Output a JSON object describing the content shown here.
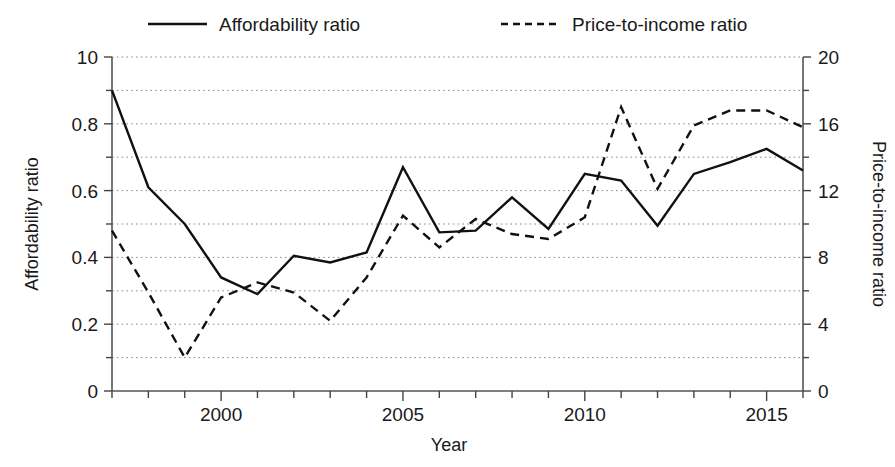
{
  "chart_data": {
    "type": "line",
    "title": "",
    "xlabel": "Year",
    "ylabel": "Affordability ratio",
    "y2label": "Price-to-income ratio",
    "grid": true,
    "legend_position": "top",
    "x": [
      1997,
      1998,
      1999,
      2000,
      2001,
      2002,
      2003,
      2004,
      2005,
      2006,
      2007,
      2008,
      2009,
      2010,
      2011,
      2012,
      2013,
      2014,
      2015,
      2016
    ],
    "xlim": [
      1997,
      2016
    ],
    "xticks": [
      2000,
      2005,
      2010,
      2015
    ],
    "xtick_labels": [
      "2000",
      "2005",
      "2010",
      "2015"
    ],
    "xticks_minor": [
      1997,
      1998,
      1999,
      2001,
      2002,
      2003,
      2004,
      2006,
      2007,
      2008,
      2009,
      2011,
      2012,
      2013,
      2014,
      2016
    ],
    "ylim": [
      0,
      1.0
    ],
    "yticks": [
      0,
      0.2,
      0.4,
      0.6,
      0.8,
      1.0
    ],
    "ytick_labels": [
      "0",
      "0.2",
      "0.4",
      "0.6",
      "0.8",
      "10"
    ],
    "yticks_minor": [
      0.1,
      0.3,
      0.5,
      0.7,
      0.9
    ],
    "y2lim": [
      0,
      20
    ],
    "y2ticks": [
      0,
      4,
      8,
      12,
      16,
      20
    ],
    "y2tick_labels": [
      "0",
      "4",
      "8",
      "12",
      "16",
      "20"
    ],
    "y2ticks_minor": [
      2,
      6,
      10,
      14,
      18
    ],
    "series": [
      {
        "name": "Affordability ratio",
        "style": "solid",
        "axis": "left",
        "color": "#111111",
        "values": [
          0.9,
          0.61,
          0.5,
          0.34,
          0.29,
          0.405,
          0.385,
          0.415,
          0.67,
          0.475,
          0.48,
          0.58,
          0.485,
          0.65,
          0.63,
          0.495,
          0.65,
          0.685,
          0.725,
          0.66
        ]
      },
      {
        "name": "Price-to-income ratio",
        "style": "dashed",
        "axis": "right",
        "color": "#111111",
        "values": [
          9.6,
          5.9,
          2.0,
          5.6,
          6.5,
          5.9,
          4.2,
          6.8,
          10.5,
          8.6,
          10.3,
          9.4,
          9.1,
          10.4,
          17.0,
          12.1,
          15.9,
          16.8,
          16.8,
          15.8
        ]
      }
    ],
    "legend": [
      {
        "label": "Affordability ratio",
        "style": "solid"
      },
      {
        "label": "Price-to-income ratio",
        "style": "dashed"
      }
    ]
  }
}
